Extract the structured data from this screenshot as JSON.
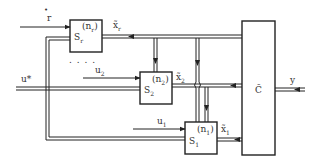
{
  "diagram": {
    "type": "block-diagram",
    "colors": {
      "line": "#222222",
      "background": "#ffffff",
      "text": "#333333"
    },
    "inputs": {
      "r": {
        "label": "r",
        "dot": "•"
      },
      "u_star": {
        "label": "u*"
      },
      "u2": {
        "label": "u",
        "sub": "2"
      },
      "u1": {
        "label": "u",
        "sub": "1"
      }
    },
    "blocks": [
      {
        "id": "Sr",
        "name": "S",
        "sub": "r",
        "order_label": "(n",
        "order_sub": "r",
        "order_close": ")",
        "output_label": "x̃",
        "output_sub": "r"
      },
      {
        "id": "S2",
        "name": "S",
        "sub": "2",
        "order_label": "(n",
        "order_sub": "2",
        "order_close": ")",
        "output_label": "x̃",
        "output_sub": "2"
      },
      {
        "id": "S1",
        "name": "S",
        "sub": "1",
        "order_label": "(n",
        "order_sub": "1",
        "order_close": ")",
        "output_label": "x̃",
        "output_sub": "1"
      }
    ],
    "combiner": {
      "label": "C̃"
    },
    "output": {
      "label": "y"
    },
    "ellipsis": ". . . ."
  }
}
